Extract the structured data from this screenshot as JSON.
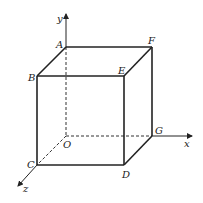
{
  "diagram": {
    "axes": {
      "x": "x",
      "y": "y",
      "z": "z"
    },
    "vertices": {
      "O": "O",
      "A": "A",
      "B": "B",
      "C": "C",
      "D": "D",
      "E": "E",
      "F": "F",
      "G": "G"
    },
    "colors": {
      "stroke": "#222222",
      "background": "#ffffff"
    }
  }
}
